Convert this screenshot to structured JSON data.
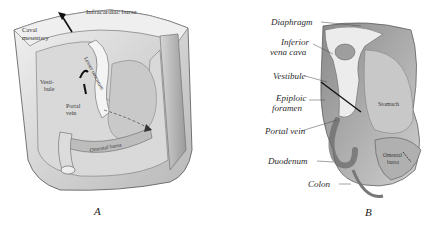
{
  "figure": {
    "panels": [
      {
        "id": "A",
        "letter": "A",
        "labels": {
          "infracardiac_bursa": "Infracardiac bursa",
          "caval_mesentery_1": "Caval",
          "caval_mesentery_2": "mesentery",
          "lesser_omentum": "Lesser omentum",
          "vestibule_1": "Vesti-",
          "vestibule_2": "bule",
          "portal_vein_1": "Portal",
          "portal_vein_2": "vein",
          "omental_bursa": "Omental bursa"
        }
      },
      {
        "id": "B",
        "letter": "B",
        "labels": {
          "diaphragm": "Diaphragm",
          "inferior_vena_cava_1": "Inferior",
          "inferior_vena_cava_2": "vena cava",
          "vestibule": "Vestibule",
          "epiploic_foramen_1": "Epiploic",
          "epiploic_foramen_2": "foramen",
          "portal_vein": "Portal vein",
          "duodenum": "Duodenum",
          "colon": "Colon",
          "stomach": "Stomach",
          "omental_bursa_1": "Omental",
          "omental_bursa_2": "bursa"
        }
      }
    ],
    "colors": {
      "background": "#ffffff",
      "tissue_light": "#e9e9e9",
      "tissue_mid": "#bdbdbd",
      "tissue_dark": "#7a7a7a",
      "ink": "#222222"
    }
  }
}
